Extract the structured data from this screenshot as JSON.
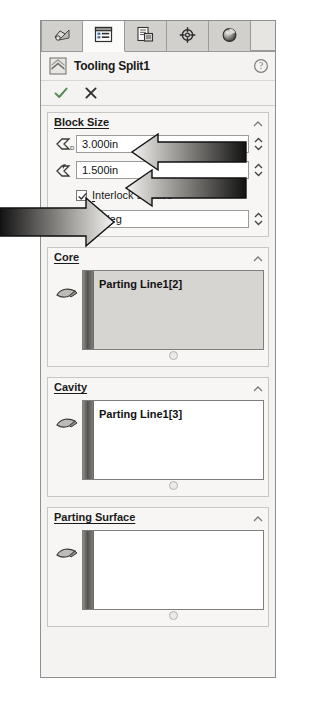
{
  "panel": {
    "title": "Tooling Split1",
    "title_icon": "tooling-split-icon",
    "help_icon": "help-icon",
    "accept_icon": "checkmark-icon",
    "cancel_icon": "cancel-x-icon",
    "collapse_icon": "chevron-up-icon"
  },
  "tabs": [
    {
      "name": "feature-manager-tree",
      "icon": "feature-tree-icon",
      "active": false
    },
    {
      "name": "property-manager",
      "icon": "property-list-icon",
      "active": true
    },
    {
      "name": "configuration-manager",
      "icon": "configuration-icon",
      "active": false
    },
    {
      "name": "dimxpert-manager",
      "icon": "dimxpert-target-icon",
      "active": false
    },
    {
      "name": "appearances-manager",
      "icon": "appearances-sphere-icon",
      "active": false
    }
  ],
  "groups": {
    "block_size": {
      "label": "Block Size",
      "fields": [
        {
          "name": "block-depth-direction1",
          "icon": "depth-d1-icon",
          "value": "3.000in",
          "spinner": true
        },
        {
          "name": "block-depth-direction2",
          "icon": "depth-d2-icon",
          "value": "1.500in",
          "spinner": true
        },
        {
          "name": "interlock-draft-angle",
          "icon": "draft-angle-icon",
          "value": "3.00deg",
          "spinner": true
        }
      ],
      "checkbox": {
        "name": "interlock-surface-checkbox",
        "label_prefix": "I",
        "label_rest": "nterlock surface",
        "checked": true
      }
    },
    "core": {
      "label": "Core",
      "icon": "surface-face-icon",
      "selected": true,
      "items": [
        "Parting Line1[2]"
      ]
    },
    "cavity": {
      "label": "Cavity",
      "icon": "surface-face-icon",
      "selected": false,
      "items": [
        "Parting Line1[3]"
      ]
    },
    "parting_surface": {
      "label": "Parting Surface",
      "icon": "surface-face-icon",
      "selected": false,
      "items": []
    }
  },
  "annotations": [
    {
      "name": "callout-arrow-block-depth1",
      "direction": "left",
      "style": "gradient-dark-to-light"
    },
    {
      "name": "callout-arrow-block-depth2",
      "direction": "left",
      "style": "gradient-dark-to-light"
    },
    {
      "name": "callout-arrow-interlock",
      "direction": "right",
      "style": "gradient-dark-to-light"
    }
  ],
  "colors": {
    "panel_bg": "#f4f3f1",
    "group_bg": "#f7f6f4",
    "selected_list_bg": "#d7d5d1",
    "border": "#8f8f8f",
    "accept_green": "#3c8f3c",
    "cancel_gray": "#303030"
  }
}
